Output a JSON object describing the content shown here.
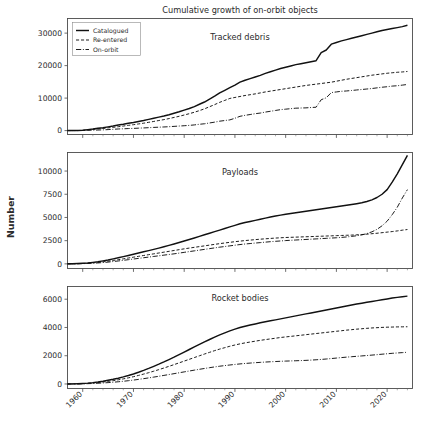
{
  "figure": {
    "title": "Cumulative growth of  on-orbit objects",
    "ylabel": "Number",
    "width": 426,
    "height": 434,
    "background": "#ffffff",
    "line_color": "#111111"
  },
  "legend": {
    "position": "upper-left-panel-1",
    "entries": [
      {
        "label": "Catalogued",
        "style": "solid"
      },
      {
        "label": "Re-entered",
        "style": "dashed"
      },
      {
        "label": "On-orbit",
        "style": "dashdot"
      }
    ]
  },
  "chart_data": [
    {
      "type": "line",
      "title": "Tracked debris",
      "xlabel": "",
      "ylabel": "Number",
      "xlim": [
        1957,
        2025
      ],
      "ylim": [
        -1200,
        34500
      ],
      "yticks": [
        0,
        10000,
        20000,
        30000
      ],
      "ytick_labels": [
        "0",
        "10000",
        "20000",
        "30000"
      ],
      "xticks": [
        1960,
        1970,
        1980,
        1990,
        2000,
        2010,
        2020
      ],
      "xtick_labels": [
        "1960",
        "1970",
        "1980",
        "1990",
        "2000",
        "2010",
        "2020"
      ],
      "grid": false,
      "x": [
        1957,
        1958,
        1959,
        1960,
        1961,
        1962,
        1963,
        1964,
        1965,
        1966,
        1967,
        1968,
        1969,
        1970,
        1971,
        1972,
        1973,
        1974,
        1975,
        1976,
        1977,
        1978,
        1979,
        1980,
        1981,
        1982,
        1983,
        1984,
        1985,
        1986,
        1987,
        1988,
        1989,
        1990,
        1991,
        1992,
        1993,
        1994,
        1995,
        1996,
        1997,
        1998,
        1999,
        2000,
        2001,
        2002,
        2003,
        2004,
        2005,
        2006,
        2007,
        2008,
        2009,
        2010,
        2011,
        2012,
        2013,
        2014,
        2015,
        2016,
        2017,
        2018,
        2019,
        2020,
        2021,
        2022,
        2023,
        2024
      ],
      "series": [
        {
          "name": "Catalogued",
          "style": "solid",
          "values": [
            5,
            20,
            45,
            120,
            300,
            480,
            700,
            900,
            1150,
            1400,
            1700,
            1950,
            2250,
            2500,
            2800,
            3100,
            3450,
            3800,
            4150,
            4500,
            4900,
            5350,
            5800,
            6300,
            6800,
            7400,
            8100,
            8800,
            9700,
            10600,
            11600,
            12400,
            13200,
            14000,
            14900,
            15500,
            16000,
            16500,
            17000,
            17600,
            18100,
            18600,
            19100,
            19500,
            19900,
            20300,
            20600,
            20900,
            21200,
            21500,
            24000,
            24800,
            26600,
            27100,
            27600,
            28000,
            28400,
            28800,
            29200,
            29600,
            30000,
            30400,
            30800,
            31100,
            31400,
            31700,
            32000,
            32400
          ]
        },
        {
          "name": "Re-entered",
          "style": "dashed",
          "values": [
            2,
            10,
            25,
            70,
            200,
            350,
            520,
            680,
            840,
            1000,
            1200,
            1400,
            1620,
            1820,
            2050,
            2280,
            2550,
            2820,
            3100,
            3380,
            3700,
            4050,
            4400,
            4800,
            5200,
            5650,
            6150,
            6700,
            7350,
            8000,
            8700,
            9300,
            9900,
            10200,
            10500,
            10800,
            11050,
            11300,
            11600,
            11900,
            12150,
            12400,
            12650,
            12900,
            13150,
            13400,
            13650,
            13900,
            14100,
            14300,
            14500,
            14700,
            14900,
            15200,
            15500,
            15800,
            16050,
            16300,
            16550,
            16800,
            17050,
            17250,
            17450,
            17650,
            17800,
            17950,
            18050,
            18200
          ]
        },
        {
          "name": "On-orbit",
          "style": "dashdot",
          "values": [
            3,
            10,
            20,
            50,
            100,
            130,
            180,
            220,
            310,
            400,
            500,
            550,
            630,
            680,
            750,
            820,
            900,
            980,
            1050,
            1120,
            1200,
            1300,
            1400,
            1500,
            1600,
            1750,
            1950,
            2100,
            2350,
            2600,
            2900,
            3100,
            3300,
            3800,
            4400,
            4700,
            4950,
            5200,
            5400,
            5700,
            5950,
            6200,
            6450,
            6600,
            6750,
            6900,
            6950,
            7000,
            7100,
            7200,
            9500,
            10100,
            11700,
            11900,
            12100,
            12200,
            12350,
            12500,
            12650,
            12800,
            12950,
            13150,
            13350,
            13500,
            13700,
            13800,
            14000,
            14200
          ]
        }
      ]
    },
    {
      "type": "line",
      "title": "Payloads",
      "xlabel": "",
      "ylabel": "Number",
      "xlim": [
        1957,
        2025
      ],
      "ylim": [
        -500,
        12000
      ],
      "yticks": [
        0,
        2500,
        5000,
        7500,
        10000
      ],
      "ytick_labels": [
        "0",
        "2500",
        "5000",
        "7500",
        "10000"
      ],
      "xticks": [
        1960,
        1970,
        1980,
        1990,
        2000,
        2010,
        2020
      ],
      "xtick_labels": [
        "1960",
        "1970",
        "1980",
        "1990",
        "2000",
        "2010",
        "2020"
      ],
      "grid": false,
      "x": [
        1957,
        1958,
        1959,
        1960,
        1961,
        1962,
        1963,
        1964,
        1965,
        1966,
        1967,
        1968,
        1969,
        1970,
        1971,
        1972,
        1973,
        1974,
        1975,
        1976,
        1977,
        1978,
        1979,
        1980,
        1981,
        1982,
        1983,
        1984,
        1985,
        1986,
        1987,
        1988,
        1989,
        1990,
        1991,
        1992,
        1993,
        1994,
        1995,
        1996,
        1997,
        1998,
        1999,
        2000,
        2001,
        2002,
        2003,
        2004,
        2005,
        2006,
        2007,
        2008,
        2009,
        2010,
        2011,
        2012,
        2013,
        2014,
        2015,
        2016,
        2017,
        2018,
        2019,
        2020,
        2021,
        2022,
        2023,
        2024
      ],
      "series": [
        {
          "name": "Catalogued",
          "style": "solid",
          "values": [
            3,
            10,
            30,
            60,
            100,
            160,
            230,
            320,
            420,
            540,
            660,
            780,
            910,
            1040,
            1170,
            1300,
            1430,
            1560,
            1700,
            1840,
            1990,
            2140,
            2300,
            2460,
            2620,
            2790,
            2960,
            3130,
            3300,
            3470,
            3640,
            3810,
            3980,
            4150,
            4320,
            4450,
            4570,
            4690,
            4810,
            4930,
            5050,
            5150,
            5250,
            5350,
            5430,
            5510,
            5590,
            5670,
            5750,
            5830,
            5910,
            5990,
            6070,
            6150,
            6230,
            6310,
            6390,
            6480,
            6580,
            6720,
            6900,
            7150,
            7500,
            8000,
            8800,
            9700,
            10700,
            11700
          ]
        },
        {
          "name": "Re-entered",
          "style": "dashed",
          "values": [
            2,
            6,
            18,
            40,
            70,
            110,
            160,
            220,
            290,
            370,
            450,
            540,
            630,
            720,
            810,
            900,
            990,
            1080,
            1170,
            1260,
            1350,
            1440,
            1530,
            1620,
            1700,
            1780,
            1860,
            1940,
            2020,
            2100,
            2180,
            2250,
            2320,
            2390,
            2450,
            2510,
            2560,
            2610,
            2660,
            2700,
            2740,
            2780,
            2810,
            2840,
            2860,
            2880,
            2900,
            2920,
            2940,
            2960,
            2980,
            3000,
            3020,
            3040,
            3060,
            3080,
            3100,
            3130,
            3160,
            3200,
            3250,
            3300,
            3360,
            3420,
            3480,
            3550,
            3630,
            3700
          ]
        },
        {
          "name": "On-orbit",
          "style": "dashdot",
          "values": [
            1,
            4,
            12,
            25,
            45,
            70,
            100,
            140,
            190,
            250,
            310,
            380,
            450,
            520,
            590,
            660,
            730,
            800,
            870,
            940,
            1010,
            1080,
            1160,
            1240,
            1320,
            1400,
            1480,
            1560,
            1640,
            1720,
            1800,
            1870,
            1940,
            2010,
            2080,
            2140,
            2190,
            2240,
            2290,
            2340,
            2390,
            2430,
            2470,
            2510,
            2540,
            2570,
            2600,
            2630,
            2660,
            2690,
            2720,
            2750,
            2780,
            2810,
            2850,
            2900,
            2960,
            3030,
            3120,
            3260,
            3450,
            3720,
            4100,
            4600,
            5300,
            6100,
            7100,
            8000
          ]
        }
      ]
    },
    {
      "type": "line",
      "title": "Rocket bodies",
      "xlabel": "",
      "ylabel": "Number",
      "xlim": [
        1957,
        2025
      ],
      "ylim": [
        -320,
        6900
      ],
      "yticks": [
        0,
        2000,
        4000,
        6000
      ],
      "ytick_labels": [
        "0",
        "2000",
        "4000",
        "6000"
      ],
      "xticks": [
        1960,
        1970,
        1980,
        1990,
        2000,
        2010,
        2020
      ],
      "xtick_labels": [
        "1960",
        "1970",
        "1980",
        "1990",
        "2000",
        "2010",
        "2020"
      ],
      "grid": false,
      "x": [
        1957,
        1958,
        1959,
        1960,
        1961,
        1962,
        1963,
        1964,
        1965,
        1966,
        1967,
        1968,
        1969,
        1970,
        1971,
        1972,
        1973,
        1974,
        1975,
        1976,
        1977,
        1978,
        1979,
        1980,
        1981,
        1982,
        1983,
        1984,
        1985,
        1986,
        1987,
        1988,
        1989,
        1990,
        1991,
        1992,
        1993,
        1994,
        1995,
        1996,
        1997,
        1998,
        1999,
        2000,
        2001,
        2002,
        2003,
        2004,
        2005,
        2006,
        2007,
        2008,
        2009,
        2010,
        2011,
        2012,
        2013,
        2014,
        2015,
        2016,
        2017,
        2018,
        2019,
        2020,
        2021,
        2022,
        2023,
        2024
      ],
      "series": [
        {
          "name": "Catalogued",
          "style": "solid",
          "values": [
            2,
            8,
            18,
            35,
            60,
            95,
            140,
            195,
            260,
            330,
            410,
            500,
            600,
            710,
            830,
            960,
            1100,
            1250,
            1400,
            1560,
            1730,
            1900,
            2080,
            2260,
            2440,
            2620,
            2800,
            2980,
            3150,
            3320,
            3480,
            3620,
            3760,
            3880,
            4000,
            4090,
            4170,
            4250,
            4330,
            4400,
            4470,
            4540,
            4610,
            4680,
            4750,
            4820,
            4890,
            4960,
            5030,
            5100,
            5170,
            5240,
            5310,
            5380,
            5450,
            5520,
            5590,
            5660,
            5720,
            5780,
            5840,
            5900,
            5960,
            6020,
            6080,
            6130,
            6180,
            6220
          ]
        },
        {
          "name": "Re-entered",
          "style": "dashed",
          "values": [
            1,
            5,
            12,
            25,
            45,
            70,
            100,
            140,
            185,
            235,
            295,
            360,
            435,
            515,
            605,
            700,
            800,
            905,
            1015,
            1130,
            1250,
            1370,
            1495,
            1620,
            1745,
            1870,
            1995,
            2120,
            2240,
            2360,
            2470,
            2570,
            2670,
            2760,
            2840,
            2910,
            2970,
            3030,
            3090,
            3140,
            3190,
            3240,
            3290,
            3330,
            3370,
            3410,
            3450,
            3490,
            3530,
            3570,
            3610,
            3650,
            3690,
            3730,
            3770,
            3810,
            3845,
            3880,
            3910,
            3940,
            3965,
            3985,
            4005,
            4020,
            4030,
            4040,
            4045,
            4050
          ]
        },
        {
          "name": "On-orbit",
          "style": "dashdot",
          "values": [
            1,
            3,
            6,
            12,
            22,
            35,
            52,
            72,
            96,
            124,
            156,
            192,
            232,
            276,
            324,
            376,
            430,
            487,
            546,
            607,
            668,
            730,
            793,
            856,
            918,
            980,
            1040,
            1098,
            1154,
            1208,
            1258,
            1302,
            1344,
            1384,
            1420,
            1452,
            1480,
            1506,
            1530,
            1552,
            1572,
            1590,
            1606,
            1620,
            1632,
            1644,
            1657,
            1672,
            1690,
            1712,
            1738,
            1768,
            1800,
            1834,
            1868,
            1900,
            1930,
            1958,
            1986,
            2014,
            2044,
            2076,
            2108,
            2140,
            2170,
            2196,
            2220,
            2245
          ]
        }
      ]
    }
  ]
}
